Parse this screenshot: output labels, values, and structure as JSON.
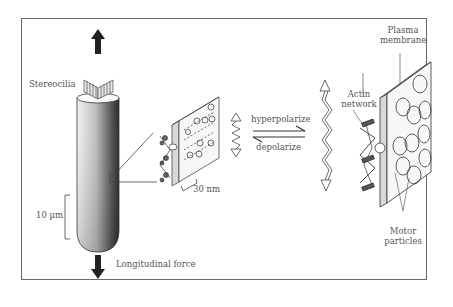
{
  "diagram": {
    "type": "scientific-illustration",
    "labels": {
      "stereocilia": "Stereocilia",
      "scale_10um": "10 µm",
      "longitudinal_force": "Longitudinal force",
      "scale_30nm": "30 nm",
      "hyperpolarize": "hyperpolarize",
      "depolarize": "depolarize",
      "actin_network_1": "Actin",
      "actin_network_2": "network",
      "plasma_membrane_1": "Plasma",
      "plasma_membrane_2": "membrane",
      "motor_particles_1": "Motor",
      "motor_particles_2": "particles"
    },
    "colors": {
      "line": "#444444",
      "text": "#555555",
      "arrow_fill": "#222222",
      "background": "#ffffff"
    }
  }
}
